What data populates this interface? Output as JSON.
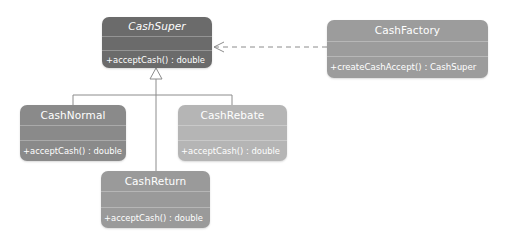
{
  "diagram": {
    "type": "uml-class-diagram",
    "classes": [
      {
        "id": "cash-super",
        "name": "CashSuper",
        "abstract": true,
        "attributes": [],
        "operations": [
          "+acceptCash() : double"
        ],
        "color": "#6b6b6b"
      },
      {
        "id": "cash-factory",
        "name": "CashFactory",
        "abstract": false,
        "attributes": [],
        "operations": [
          "+createCashAccept() : CashSuper"
        ],
        "color": "#9c9c9c"
      },
      {
        "id": "cash-normal",
        "name": "CashNormal",
        "abstract": false,
        "attributes": [],
        "operations": [
          "+acceptCash() : double"
        ],
        "color": "#8a8a8a"
      },
      {
        "id": "cash-rebate",
        "name": "CashRebate",
        "abstract": false,
        "attributes": [],
        "operations": [
          "+acceptCash() : double"
        ],
        "color": "#b5b5b5"
      },
      {
        "id": "cash-return",
        "name": "CashReturn",
        "abstract": false,
        "attributes": [],
        "operations": [
          "+acceptCash() : double"
        ],
        "color": "#9a9a9a"
      }
    ],
    "relationships": [
      {
        "type": "dependency",
        "from": "CashFactory",
        "to": "CashSuper",
        "style": "dashed-open-arrow"
      },
      {
        "type": "generalization",
        "from": "CashNormal",
        "to": "CashSuper",
        "style": "hollow-triangle"
      },
      {
        "type": "generalization",
        "from": "CashRebate",
        "to": "CashSuper",
        "style": "hollow-triangle"
      },
      {
        "type": "generalization",
        "from": "CashReturn",
        "to": "CashSuper",
        "style": "hollow-triangle"
      }
    ],
    "colors": {
      "connector": "#8c8c8c",
      "background": "#ffffff"
    }
  }
}
